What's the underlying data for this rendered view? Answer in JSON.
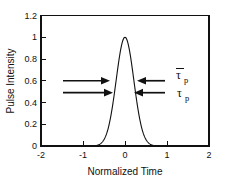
{
  "chart_data": {
    "type": "line",
    "title": "",
    "xlabel": "Normalized Time",
    "ylabel": "Pulse Intensity",
    "xlim": [
      -2,
      2
    ],
    "ylim": [
      0,
      1.2
    ],
    "grid": false,
    "legend": "none",
    "xticks": [
      -2,
      -1,
      0,
      1,
      2
    ],
    "xticklabels": [
      "-2",
      "-1",
      "0",
      "1",
      "2"
    ],
    "yticks": [
      0,
      0.2,
      0.4,
      0.6,
      0.8,
      1,
      1.2
    ],
    "yticklabels": [
      "0",
      "0.2",
      "0.4",
      "0.6",
      "0.8",
      "1",
      "1.2"
    ],
    "series": [
      {
        "name": "Pulse Intensity",
        "description": "Gaussian pulse centered at 0 with peak intensity 1.0",
        "peak_x": 0,
        "peak_y": 1.0,
        "sigma": 0.21,
        "x": [
          -2.0,
          -1.8,
          -1.6,
          -1.4,
          -1.2,
          -1.0,
          -0.9,
          -0.8,
          -0.7,
          -0.6,
          -0.5,
          -0.45,
          -0.4,
          -0.35,
          -0.3,
          -0.25,
          -0.2,
          -0.15,
          -0.1,
          -0.05,
          0.0,
          0.05,
          0.1,
          0.15,
          0.2,
          0.25,
          0.3,
          0.35,
          0.4,
          0.45,
          0.5,
          0.6,
          0.7,
          0.8,
          0.9,
          1.0,
          1.2,
          1.4,
          1.6,
          1.8,
          2.0
        ],
        "y": [
          0.0,
          0.0,
          0.0,
          0.0,
          0.0,
          0.0,
          0.0,
          0.001,
          0.004,
          0.017,
          0.059,
          0.101,
          0.163,
          0.249,
          0.359,
          0.488,
          0.624,
          0.753,
          0.872,
          0.944,
          1.0,
          0.944,
          0.872,
          0.753,
          0.624,
          0.488,
          0.359,
          0.249,
          0.163,
          0.101,
          0.059,
          0.017,
          0.004,
          0.001,
          0.0,
          0.0,
          0.0,
          0.0,
          0.0,
          0.0,
          0.0
        ]
      }
    ],
    "annotations": [
      {
        "id": "tau-bar-p",
        "label": "τ",
        "subscript": "p",
        "overbar": true,
        "y_value": 0.6,
        "description": "Arrows pointing inward at intensity 0.6 marking mean pulse width tau-bar sub p",
        "left_arrow": {
          "from_x": -1.05,
          "to_x": -0.36,
          "direction": "right"
        },
        "right_arrow": {
          "from_x": 0.98,
          "to_x": 0.3,
          "direction": "left"
        },
        "label_x": 1.22
      },
      {
        "id": "tau-p",
        "label": "τ",
        "subscript": "p",
        "overbar": false,
        "y_value": 0.49,
        "description": "Arrows pointing inward at intensity 0.49 marking pulse width tau sub p",
        "left_arrow": {
          "from_x": -1.05,
          "to_x": -0.28,
          "direction": "right"
        },
        "right_arrow": {
          "from_x": 0.98,
          "to_x": 0.22,
          "direction": "left"
        },
        "label_x": 1.25
      }
    ]
  },
  "figure": {
    "background_color": "#ffffff",
    "line_color": "#111111",
    "axis_color": "#111111"
  }
}
